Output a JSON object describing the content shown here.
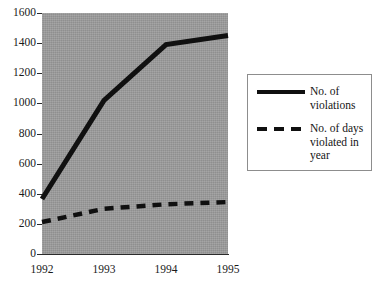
{
  "chart_data": {
    "type": "line",
    "title": "",
    "xlabel": "",
    "ylabel": "",
    "categories": [
      "1992",
      "1993",
      "1994",
      "1995"
    ],
    "x": [
      1992,
      1993,
      1994,
      1995
    ],
    "ylim": [
      0,
      1600
    ],
    "yticks": [
      "0",
      "200",
      "400",
      "600",
      "800",
      "1000",
      "1200",
      "1400",
      "1600"
    ],
    "ytick_values": [
      0,
      200,
      400,
      600,
      800,
      1000,
      1200,
      1400,
      1600
    ],
    "grid": false,
    "legend_position": "right",
    "plot_background": "#9b9b9b",
    "page_background": "#ffffff",
    "series": [
      {
        "name": "No. of violations",
        "legend_label": "No. of\nviolations",
        "style": "solid",
        "color": "#101010",
        "values": [
          365,
          1020,
          1390,
          1450
        ]
      },
      {
        "name": "No. of days violated in year",
        "legend_label": "No. of days\nviolated in\nyear",
        "style": "dashed",
        "color": "#101010",
        "values": [
          212,
          300,
          330,
          345
        ]
      }
    ]
  },
  "legend": {
    "entry_1_label": "No. of\nviolations",
    "entry_2_label": "No. of days\nviolated in\nyear",
    "key_1": "solid-line-key",
    "key_2": "dashed-line-key"
  }
}
